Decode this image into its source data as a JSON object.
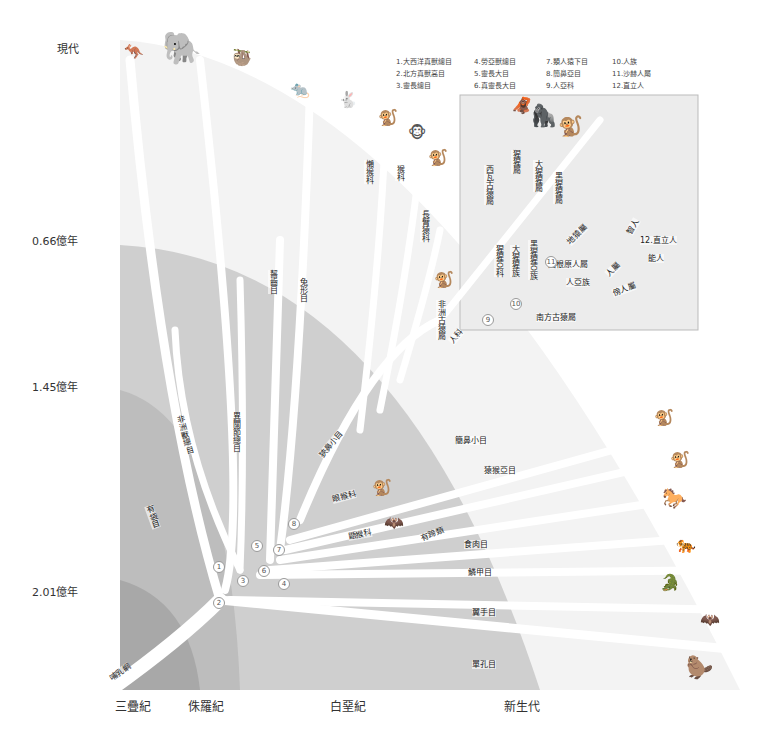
{
  "axis": {
    "time_labels": [
      "現代",
      "0.66億年",
      "1.45億年",
      "2.01億年"
    ],
    "era_labels": [
      "三疊紀",
      "侏羅紀",
      "白堊紀",
      "新生代"
    ]
  },
  "legend": [
    "1.大西洋真獸總目",
    "4.勞亞獸總目",
    "7.類人猿下目",
    "10.人族",
    "2.北方真獸高目",
    "5.靈長大目",
    "8.簡鼻亞目",
    "11.沙赫人屬",
    "3.靈長總目",
    "6.真靈長大目",
    "9.人亞科",
    "12.直立人"
  ],
  "root": "哺乳綱",
  "branches": {
    "marsupials": "有袋目",
    "afrotheria": "非洲獸總目",
    "xenarthra": "異關節總目",
    "rodentia": "齧齒目",
    "lagomorpha": "兔形目",
    "lorisidae": "懶猴科",
    "cercopithecidae": "猴科",
    "hylobatidae": "長臂猿科",
    "catarrhini": "狹鼻小目",
    "tarsiidae": "眼猴科",
    "dermoptera": "鼯猴科",
    "haplorhini": "簡鼻小目",
    "strepsirrhini": "猿猴亞目",
    "ungulates": "有蹄類",
    "carnivora": "食肉目",
    "pholidota": "鱗甲目",
    "chiroptera": "翼手目",
    "monotremata": "單孔目",
    "proconsul": "非洲古猿屬",
    "hominidae": "人科"
  },
  "inset": {
    "sivapithecus": "西瓦古猿屬",
    "pongo": "猩猩屬",
    "gorilla": "大猩猩屬",
    "pan": "黑猩猩屬",
    "ponginae": "猩猩亞科",
    "gorillini": "大猩猩族",
    "panina": "黑猩猩亞族",
    "ardipithecus": "地猿屬",
    "orrorin": "圖根原人屬",
    "hominina": "人亞族",
    "homo": "人屬",
    "paranthropus": "傍人屬",
    "australopithecus": "南方古猿屬",
    "sapiens": "智人",
    "erectus": "12.直立人",
    "habilis": "能人"
  },
  "node_numbers": [
    "1",
    "2",
    "3",
    "4",
    "5",
    "6",
    "7",
    "8",
    "9",
    "10",
    "11"
  ]
}
